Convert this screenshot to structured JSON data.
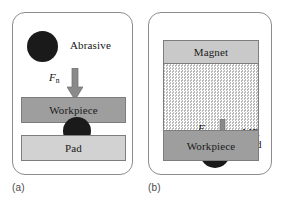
{
  "figure": {
    "panels": [
      {
        "id": "a",
        "caption": "(a)",
        "annotations": {
          "abrasive": "Abrasive",
          "force": "F",
          "force_sub": "n"
        },
        "layers": [
          {
            "name": "workpiece",
            "label": "Workpiece",
            "color": "#9e9e9e"
          },
          {
            "name": "pad",
            "label": "Pad",
            "color": "#d2d2d2"
          }
        ]
      },
      {
        "id": "b",
        "caption": "(b)",
        "annotations": {
          "mr_fluid_line1": "MR",
          "mr_fluid_line2": "fluid",
          "force": "F",
          "force_sub": "n"
        },
        "layers": [
          {
            "name": "magnet",
            "label": "Magnet",
            "color": "#c9c9c9"
          },
          {
            "name": "mr-fluid",
            "label": "",
            "color": "#b9b9b9"
          },
          {
            "name": "workpiece",
            "label": "Workpiece",
            "color": "#9e9e9e"
          }
        ]
      }
    ],
    "colors": {
      "particle": "#1a1a1a",
      "arrow": "#8a8a8a",
      "frame_border": "#8c8c8c",
      "bar_border": "#7d7d7d",
      "background": "#ffffff"
    }
  }
}
